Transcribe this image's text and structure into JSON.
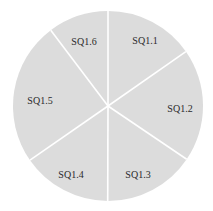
{
  "chart_data": {
    "type": "pie",
    "title": "",
    "categories": [
      "SQ1.1",
      "SQ1.2",
      "SQ1.3",
      "SQ1.4",
      "SQ1.5",
      "SQ1.6"
    ],
    "values": [
      15.3,
      19.2,
      15.6,
      15.3,
      24.4,
      10.3
    ],
    "start_angle_deg": 0,
    "direction": "clockwise",
    "legend": "none",
    "fill_color": "#dcdcdc",
    "separator_color": "#ffffff",
    "label_color": "#2a2a2a"
  },
  "labels": {
    "s1": "SQ1.1",
    "s2": "SQ1.2",
    "s3": "SQ1.3",
    "s4": "SQ1.4",
    "s5": "SQ1.5",
    "s6": "SQ1.6"
  }
}
